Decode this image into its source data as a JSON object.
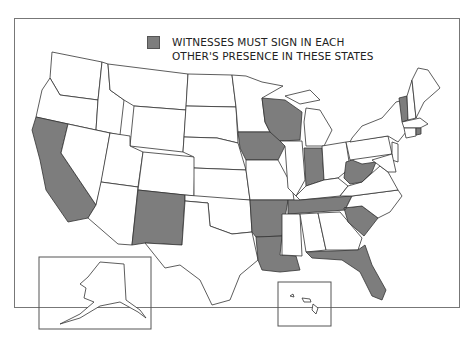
{
  "map": {
    "type": "choropleth",
    "region": "United States",
    "legend": {
      "swatch_color": "#7d7d7d",
      "line1": "WITNESSES MUST SIGN IN EACH",
      "line2": "OTHER'S PRESENCE IN THESE STATES"
    },
    "highlight_color": "#7d7d7d",
    "base_color": "#ffffff",
    "highlighted_states": [
      "California",
      "New Mexico",
      "Iowa",
      "Wisconsin",
      "Indiana",
      "Arkansas",
      "Louisiana",
      "Tennessee",
      "West Virginia",
      "South Carolina",
      "Florida",
      "Vermont",
      "Rhode Island"
    ],
    "insets": [
      "Alaska",
      "Hawaii"
    ]
  }
}
